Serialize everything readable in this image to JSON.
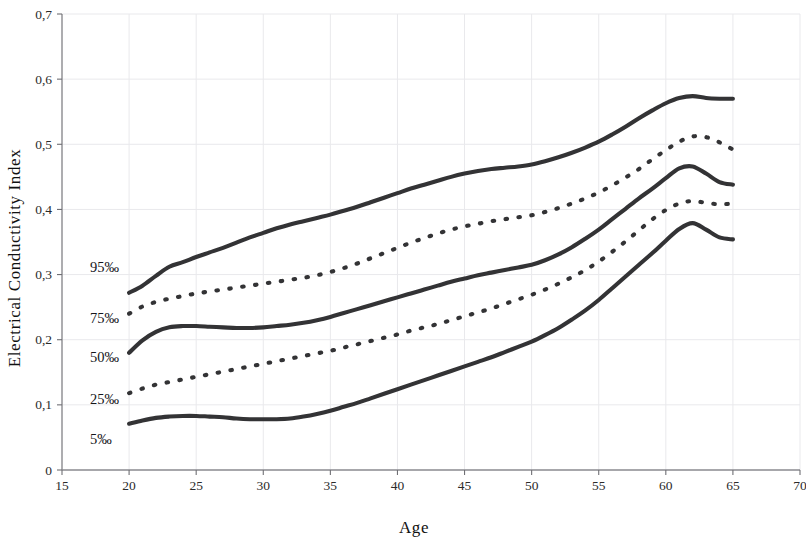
{
  "chart_data": {
    "type": "line",
    "title": "",
    "xlabel": "Age",
    "ylabel": "Electrical Conductivity Index",
    "xlim": [
      15,
      70
    ],
    "ylim": [
      0,
      0.7
    ],
    "grid": true,
    "legend_position": "inline-left",
    "x_ticks": [
      "15",
      "20",
      "25",
      "30",
      "35",
      "40",
      "45",
      "50",
      "55",
      "60",
      "65",
      "70"
    ],
    "x_tick_values": [
      15,
      20,
      25,
      30,
      35,
      40,
      45,
      50,
      55,
      60,
      65,
      70
    ],
    "y_ticks": [
      "0",
      "0,1",
      "0,2",
      "0,3",
      "0,4",
      "0,5",
      "0,6",
      "0,7"
    ],
    "y_tick_values": [
      0,
      0.1,
      0.2,
      0.3,
      0.4,
      0.5,
      0.6,
      0.7
    ],
    "x": [
      20,
      21,
      22,
      23,
      24,
      25,
      26,
      27,
      28,
      29,
      30,
      31,
      32,
      33,
      34,
      35,
      36,
      37,
      38,
      39,
      40,
      41,
      42,
      43,
      44,
      45,
      46,
      47,
      48,
      49,
      50,
      51,
      52,
      53,
      54,
      55,
      56,
      57,
      58,
      59,
      60,
      61,
      62,
      63,
      64,
      65
    ],
    "series": [
      {
        "name": "95‰",
        "style": "solid",
        "label": "95‰",
        "values": [
          0.272,
          0.283,
          0.298,
          0.312,
          0.319,
          0.327,
          0.334,
          0.341,
          0.349,
          0.357,
          0.364,
          0.371,
          0.377,
          0.382,
          0.387,
          0.392,
          0.398,
          0.404,
          0.411,
          0.418,
          0.425,
          0.432,
          0.438,
          0.444,
          0.45,
          0.455,
          0.459,
          0.462,
          0.464,
          0.466,
          0.469,
          0.474,
          0.48,
          0.487,
          0.495,
          0.504,
          0.515,
          0.527,
          0.54,
          0.552,
          0.563,
          0.571,
          0.574,
          0.571,
          0.57,
          0.57
        ]
      },
      {
        "name": "75‰",
        "style": "dotted",
        "label": "75‰",
        "values": [
          0.24,
          0.251,
          0.258,
          0.263,
          0.267,
          0.271,
          0.274,
          0.277,
          0.28,
          0.283,
          0.286,
          0.289,
          0.292,
          0.295,
          0.299,
          0.304,
          0.31,
          0.317,
          0.325,
          0.333,
          0.341,
          0.349,
          0.356,
          0.363,
          0.369,
          0.374,
          0.378,
          0.382,
          0.385,
          0.388,
          0.391,
          0.396,
          0.402,
          0.409,
          0.417,
          0.426,
          0.437,
          0.449,
          0.462,
          0.477,
          0.491,
          0.504,
          0.512,
          0.511,
          0.503,
          0.492
        ]
      },
      {
        "name": "50‰",
        "style": "solid",
        "label": "50‰",
        "values": [
          0.18,
          0.199,
          0.212,
          0.219,
          0.221,
          0.221,
          0.22,
          0.219,
          0.218,
          0.218,
          0.219,
          0.221,
          0.223,
          0.226,
          0.23,
          0.235,
          0.241,
          0.247,
          0.253,
          0.259,
          0.265,
          0.271,
          0.277,
          0.283,
          0.289,
          0.294,
          0.299,
          0.303,
          0.307,
          0.311,
          0.315,
          0.322,
          0.331,
          0.342,
          0.355,
          0.369,
          0.385,
          0.401,
          0.417,
          0.432,
          0.448,
          0.463,
          0.466,
          0.455,
          0.442,
          0.438
        ]
      },
      {
        "name": "25‰",
        "style": "dotted",
        "label": "25‰",
        "values": [
          0.118,
          0.125,
          0.131,
          0.135,
          0.139,
          0.143,
          0.147,
          0.151,
          0.155,
          0.159,
          0.163,
          0.167,
          0.171,
          0.175,
          0.179,
          0.183,
          0.188,
          0.193,
          0.198,
          0.203,
          0.208,
          0.214,
          0.219,
          0.224,
          0.23,
          0.236,
          0.242,
          0.248,
          0.255,
          0.262,
          0.269,
          0.277,
          0.286,
          0.296,
          0.307,
          0.32,
          0.335,
          0.351,
          0.368,
          0.385,
          0.399,
          0.409,
          0.413,
          0.41,
          0.408,
          0.409
        ]
      },
      {
        "name": "5‰",
        "style": "solid",
        "label": "5‰",
        "values": [
          0.071,
          0.076,
          0.08,
          0.082,
          0.083,
          0.083,
          0.082,
          0.081,
          0.079,
          0.078,
          0.078,
          0.078,
          0.079,
          0.082,
          0.086,
          0.091,
          0.097,
          0.103,
          0.11,
          0.117,
          0.124,
          0.131,
          0.138,
          0.145,
          0.152,
          0.159,
          0.166,
          0.173,
          0.181,
          0.189,
          0.197,
          0.207,
          0.218,
          0.231,
          0.245,
          0.261,
          0.279,
          0.297,
          0.315,
          0.333,
          0.352,
          0.37,
          0.379,
          0.369,
          0.357,
          0.354
        ]
      }
    ],
    "curve_labels": [
      {
        "text": "95‰",
        "x_px": 90,
        "y_px": 272
      },
      {
        "text": "75‰",
        "x_px": 90,
        "y_px": 323
      },
      {
        "text": "50‰",
        "x_px": 90,
        "y_px": 362
      },
      {
        "text": "25‰",
        "x_px": 90,
        "y_px": 404
      },
      {
        "text": "5‰",
        "x_px": 90,
        "y_px": 444
      }
    ],
    "colors": {
      "line": "#333335",
      "grid": "#e9e9ec",
      "axis": "#8a8a8f",
      "text": "#1d1d1d",
      "background": "#ffffff"
    }
  }
}
